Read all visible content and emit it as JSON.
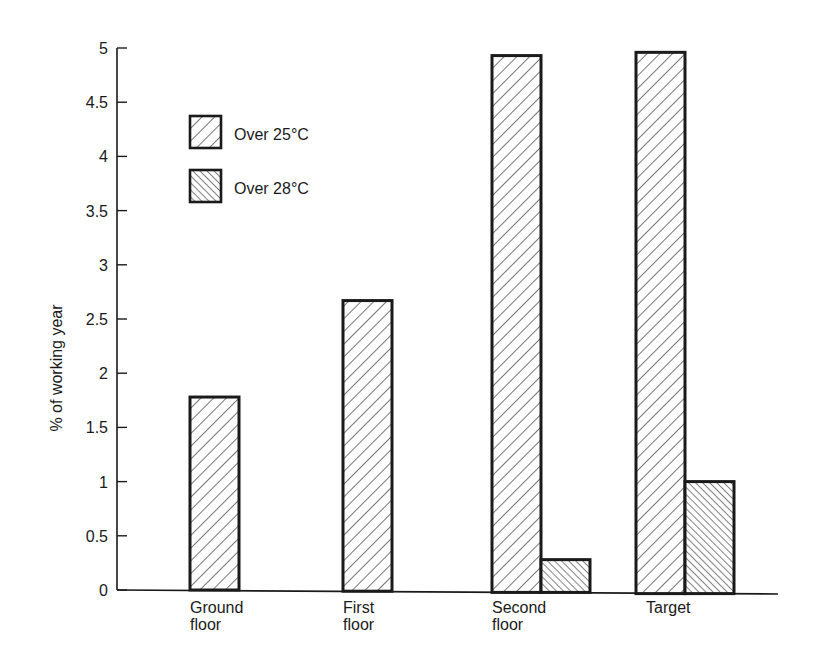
{
  "chart_data": {
    "type": "bar",
    "title": "",
    "xlabel": "",
    "ylabel": "% of working year",
    "ylim": [
      0,
      5
    ],
    "yticks": [
      "0",
      "0.5",
      "1",
      "1.5",
      "2",
      "2.5",
      "3",
      "3.5",
      "4",
      "4.5",
      "5"
    ],
    "categories": [
      "Ground floor",
      "First floor",
      "Second floor",
      "Target"
    ],
    "category_label_lines": [
      [
        "Ground",
        "floor"
      ],
      [
        "First",
        "floor"
      ],
      [
        "Second",
        "floor"
      ],
      [
        "Target"
      ]
    ],
    "series": [
      {
        "name": "Over 25°C",
        "pattern": "light-diagonal-hatch",
        "values": [
          1.78,
          2.67,
          4.93,
          4.96
        ]
      },
      {
        "name": "Over 28°C",
        "pattern": "dense-reverse-diagonal-hatch",
        "values": [
          null,
          null,
          0.28,
          1.0
        ]
      }
    ],
    "legend_position": "upper-left-inside",
    "grid": false
  },
  "colors": {
    "ink": "#1a1a1a",
    "background": "#ffffff"
  }
}
